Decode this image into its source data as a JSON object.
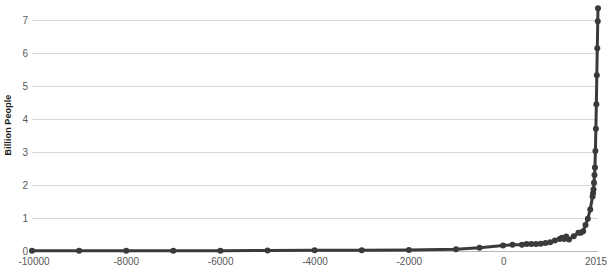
{
  "chart_data": {
    "type": "line",
    "title": "",
    "xlabel": "",
    "ylabel": "Billion People",
    "xlim": [
      -10000,
      2015
    ],
    "ylim": [
      0,
      7.6
    ],
    "grid": true,
    "legend": null,
    "markers": true,
    "line_color": "#3a3a3a",
    "grid_color": "#d8d8d8",
    "axis_text_color": "#58585a",
    "yticks": [
      0,
      1,
      2,
      3,
      4,
      5,
      6,
      7
    ],
    "ytick_labels": [
      "0",
      "1",
      "2",
      "3",
      "4",
      "5",
      "6",
      "7"
    ],
    "xticks": [
      -10000,
      -8000,
      -6000,
      -4000,
      -2000,
      0,
      2015
    ],
    "xtick_labels": [
      "-10000",
      "-8000",
      "-6000",
      "-4000",
      "-2000",
      "0",
      "2015"
    ],
    "x": [
      -10000,
      -9000,
      -8000,
      -7000,
      -6000,
      -5000,
      -4000,
      -3000,
      -2000,
      -1000,
      -500,
      0,
      200,
      400,
      500,
      600,
      700,
      800,
      900,
      1000,
      1100,
      1200,
      1250,
      1300,
      1340,
      1400,
      1500,
      1600,
      1650,
      1700,
      1750,
      1800,
      1850,
      1900,
      1910,
      1920,
      1930,
      1940,
      1950,
      1960,
      1970,
      1980,
      1990,
      2000,
      2010,
      2015
    ],
    "y": [
      0.004,
      0.005,
      0.005,
      0.007,
      0.01,
      0.015,
      0.02,
      0.025,
      0.03,
      0.05,
      0.1,
      0.17,
      0.19,
      0.19,
      0.21,
      0.21,
      0.21,
      0.22,
      0.24,
      0.265,
      0.32,
      0.36,
      0.4,
      0.36,
      0.44,
      0.35,
      0.45,
      0.55,
      0.55,
      0.6,
      0.79,
      0.98,
      1.26,
      1.65,
      1.75,
      1.86,
      2.07,
      2.3,
      2.53,
      3.03,
      3.7,
      4.44,
      5.32,
      6.14,
      6.96,
      7.35
    ],
    "series_name": "World Population"
  },
  "axis": {
    "y_title": "Billion People"
  }
}
